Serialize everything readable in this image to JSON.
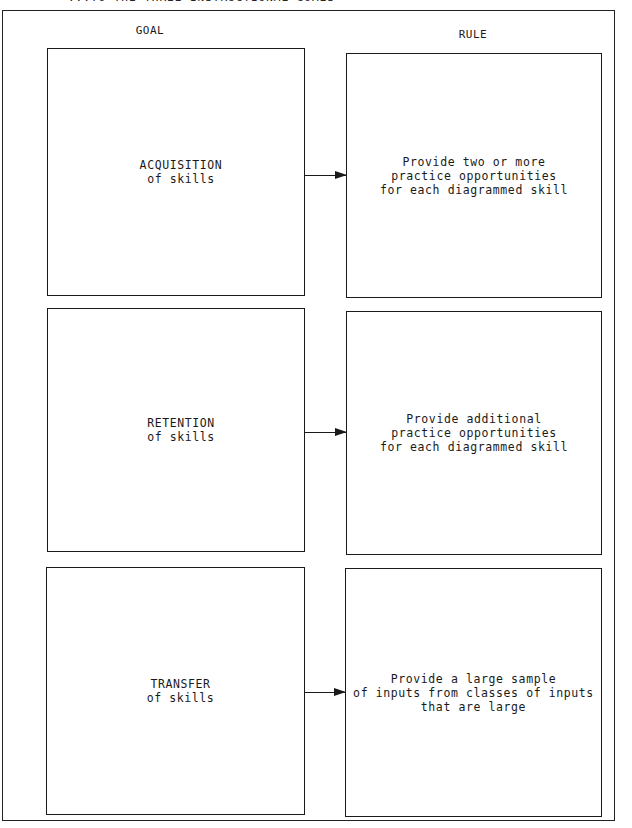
{
  "caption": "...TO THE THREE INSTRUCTIONAL GOALS",
  "columns": {
    "goal": "GOAL",
    "rule": "RULE"
  },
  "rows": [
    {
      "goal": "ACQUISITION\nof skills",
      "rule": "Provide two or more\npractice opportunities\nfor each diagrammed skill"
    },
    {
      "goal": "RETENTION\nof skills",
      "rule": "Provide additional\npractice opportunities\nfor each diagrammed skill"
    },
    {
      "goal": "TRANSFER\nof skills",
      "rule": "Provide a large sample\nof inputs from classes of inputs\nthat are large"
    }
  ]
}
